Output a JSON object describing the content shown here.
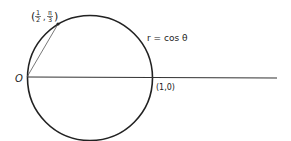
{
  "diagram": {
    "curve_label": "r = cos θ",
    "origin_label": "O",
    "point_label": {
      "open": "(",
      "num1": "1",
      "den1": "2",
      "sep": ",",
      "num2": "π",
      "den2": "3",
      "close": ")"
    },
    "intercept_label": "(1,0)",
    "colors": {
      "stroke": "#222222",
      "background": "#ffffff"
    }
  }
}
